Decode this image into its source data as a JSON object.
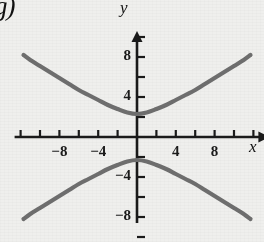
{
  "figure": {
    "part_label": "g)",
    "background_color": "#efefed",
    "axis_color": "#1a1a1a",
    "curve_color": "#6e6e6e"
  },
  "chart_data": {
    "type": "line",
    "title": "",
    "subtitle": "",
    "xlabel": "x",
    "ylabel": "y",
    "xlim": [
      -12,
      12
    ],
    "ylim": [
      -10,
      10
    ],
    "grid": false,
    "legend": false,
    "legend_position": "none",
    "x_tick_step": 2,
    "y_tick_step": 2,
    "x_labeled_ticks": [
      {
        "value": -8,
        "label": "−8"
      },
      {
        "value": -4,
        "label": "−4"
      },
      {
        "value": 4,
        "label": "4"
      },
      {
        "value": 8,
        "label": "8"
      }
    ],
    "y_labeled_ticks": [
      {
        "value": 8,
        "label": "8"
      },
      {
        "value": 4,
        "label": "4"
      },
      {
        "value": -4,
        "label": "−4"
      },
      {
        "value": -8,
        "label": "−8"
      }
    ],
    "annotations": [
      "g)"
    ],
    "series": [
      {
        "name": "upper-branch",
        "points": [
          [
            -11.7,
            8.2
          ],
          [
            -11.0,
            7.7
          ],
          [
            -10.0,
            7.1
          ],
          [
            -9.0,
            6.5
          ],
          [
            -8.0,
            5.9
          ],
          [
            -7.0,
            5.3
          ],
          [
            -6.0,
            4.7
          ],
          [
            -5.0,
            4.2
          ],
          [
            -4.0,
            3.7
          ],
          [
            -3.0,
            3.2
          ],
          [
            -2.0,
            2.8
          ],
          [
            -1.0,
            2.45
          ],
          [
            0.0,
            2.3
          ],
          [
            1.0,
            2.45
          ],
          [
            2.0,
            2.8
          ],
          [
            3.0,
            3.2
          ],
          [
            4.0,
            3.7
          ],
          [
            5.0,
            4.2
          ],
          [
            6.0,
            4.7
          ],
          [
            7.0,
            5.3
          ],
          [
            8.0,
            5.9
          ],
          [
            9.0,
            6.5
          ],
          [
            10.0,
            7.1
          ],
          [
            11.0,
            7.7
          ],
          [
            11.7,
            8.2
          ]
        ]
      },
      {
        "name": "lower-branch",
        "points": [
          [
            -11.7,
            -8.2
          ],
          [
            -11.0,
            -7.7
          ],
          [
            -10.0,
            -7.1
          ],
          [
            -9.0,
            -6.5
          ],
          [
            -8.0,
            -5.9
          ],
          [
            -7.0,
            -5.3
          ],
          [
            -6.0,
            -4.7
          ],
          [
            -5.0,
            -4.2
          ],
          [
            -4.0,
            -3.7
          ],
          [
            -3.0,
            -3.2
          ],
          [
            -2.0,
            -2.8
          ],
          [
            -1.0,
            -2.45
          ],
          [
            0.0,
            -2.3
          ],
          [
            1.0,
            -2.45
          ],
          [
            2.0,
            -2.8
          ],
          [
            3.0,
            -3.2
          ],
          [
            4.0,
            -3.7
          ],
          [
            5.0,
            -4.2
          ],
          [
            6.0,
            -4.7
          ],
          [
            7.0,
            -5.3
          ],
          [
            8.0,
            -5.9
          ],
          [
            9.0,
            -6.5
          ],
          [
            10.0,
            -7.1
          ],
          [
            11.0,
            -7.7
          ],
          [
            11.7,
            -8.2
          ]
        ]
      }
    ]
  }
}
